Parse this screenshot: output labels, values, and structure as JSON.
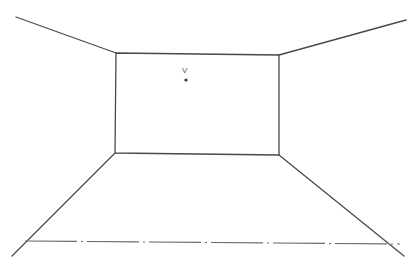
{
  "diagram": {
    "vanishing_point": {
      "label": "V",
      "x": 186,
      "y": 80,
      "label_x": 182,
      "label_y": 73
    },
    "back_wall": {
      "x1": 116,
      "y1": 53,
      "x2": 279,
      "y2": 55,
      "x3": 279,
      "y3": 155,
      "x4": 115,
      "y4": 153
    },
    "edges": [
      {
        "name": "top-left-edge",
        "x1": 16,
        "y1": 17,
        "x2": 116,
        "y2": 53
      },
      {
        "name": "top-right-edge",
        "x1": 279,
        "y1": 55,
        "x2": 406,
        "y2": 20
      },
      {
        "name": "bottom-left-edge",
        "x1": 115,
        "y1": 153,
        "x2": 12,
        "y2": 256
      },
      {
        "name": "bottom-right-edge",
        "x1": 279,
        "y1": 155,
        "x2": 404,
        "y2": 256
      }
    ],
    "ground_line": {
      "x1": 25,
      "y1": 241,
      "x2": 400,
      "y2": 244,
      "style": "dash-dot"
    },
    "colors": {
      "line": "#4a4a4a",
      "ground_line": "#6a6a6a",
      "background": "#ffffff"
    }
  }
}
